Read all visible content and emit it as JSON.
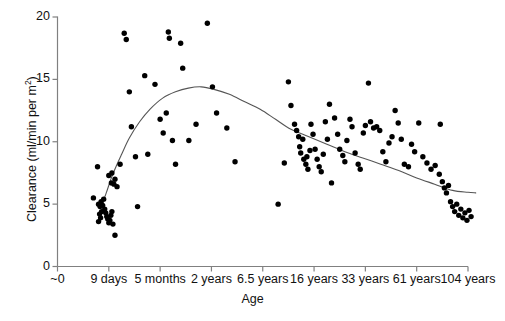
{
  "chart_data": {
    "type": "scatter",
    "title": "",
    "xlabel": "Age",
    "ylabel": "Clearance (ml/min per m²)",
    "ylim": [
      0,
      20
    ],
    "yticks": [
      0,
      5,
      10,
      15,
      20
    ],
    "ytick_labels": [
      "0",
      "5",
      "10",
      "15",
      "20"
    ],
    "xtick_labels": [
      "~0",
      "9 days",
      "5 months",
      "2 years",
      "6.5 years",
      "16 years",
      "33 years",
      "61 years",
      "104 years"
    ],
    "xtick_index": [
      0,
      1,
      2,
      3,
      4,
      5,
      6,
      7,
      8
    ],
    "grid": false,
    "legend": false,
    "marker_color": "#000000",
    "trend_color": "#555555",
    "axis_color": "#808080",
    "note": "x axis is an ordinal age scale; x values below are tick-index units (0 = ~0, 8 = 104 years)",
    "series": [
      {
        "name": "Clearance",
        "points": [
          [
            0.78,
            8.0
          ],
          [
            0.7,
            5.5
          ],
          [
            0.8,
            5.0
          ],
          [
            0.83,
            4.8
          ],
          [
            0.85,
            5.2
          ],
          [
            0.86,
            4.4
          ],
          [
            0.88,
            4.9
          ],
          [
            0.82,
            4.2
          ],
          [
            0.84,
            3.9
          ],
          [
            0.8,
            3.6
          ],
          [
            0.9,
            5.4
          ],
          [
            0.92,
            4.6
          ],
          [
            0.94,
            4.3
          ],
          [
            0.96,
            4.0
          ],
          [
            0.98,
            3.8
          ],
          [
            1.0,
            3.5
          ],
          [
            1.02,
            3.7
          ],
          [
            1.04,
            4.1
          ],
          [
            1.06,
            4.4
          ],
          [
            1.08,
            3.4
          ],
          [
            1.12,
            2.5
          ],
          [
            1.0,
            7.3
          ],
          [
            1.05,
            6.7
          ],
          [
            1.1,
            6.6
          ],
          [
            1.16,
            6.4
          ],
          [
            1.12,
            7.0
          ],
          [
            1.06,
            7.5
          ],
          [
            1.22,
            8.2
          ],
          [
            1.3,
            18.7
          ],
          [
            1.34,
            18.2
          ],
          [
            1.4,
            14.0
          ],
          [
            1.44,
            11.2
          ],
          [
            1.52,
            8.8
          ],
          [
            1.56,
            4.8
          ],
          [
            1.7,
            15.3
          ],
          [
            1.76,
            9.0
          ],
          [
            1.9,
            14.6
          ],
          [
            2.0,
            11.8
          ],
          [
            2.06,
            10.7
          ],
          [
            2.12,
            12.3
          ],
          [
            2.16,
            18.8
          ],
          [
            2.18,
            18.3
          ],
          [
            2.24,
            10.1
          ],
          [
            2.3,
            8.2
          ],
          [
            2.4,
            17.9
          ],
          [
            2.44,
            15.9
          ],
          [
            2.56,
            10.1
          ],
          [
            2.7,
            11.4
          ],
          [
            2.92,
            19.5
          ],
          [
            3.02,
            14.4
          ],
          [
            3.1,
            12.3
          ],
          [
            3.3,
            11.1
          ],
          [
            3.46,
            8.4
          ],
          [
            4.55,
            12.9
          ],
          [
            4.62,
            11.4
          ],
          [
            4.66,
            10.9
          ],
          [
            4.7,
            10.4
          ],
          [
            4.72,
            9.6
          ],
          [
            4.74,
            9.1
          ],
          [
            4.78,
            10.2
          ],
          [
            4.8,
            8.6
          ],
          [
            4.84,
            8.2
          ],
          [
            4.86,
            8.8
          ],
          [
            4.88,
            7.8
          ],
          [
            4.92,
            9.3
          ],
          [
            4.42,
            8.3
          ],
          [
            4.5,
            14.8
          ],
          [
            4.94,
            11.4
          ],
          [
            4.98,
            10.6
          ],
          [
            5.02,
            9.4
          ],
          [
            5.06,
            8.6
          ],
          [
            5.1,
            8.0
          ],
          [
            5.14,
            7.6
          ],
          [
            5.18,
            9.0
          ],
          [
            5.22,
            11.6
          ],
          [
            5.26,
            10.2
          ],
          [
            5.3,
            13.0
          ],
          [
            5.34,
            6.7
          ],
          [
            5.4,
            11.9
          ],
          [
            5.46,
            10.6
          ],
          [
            5.5,
            9.4
          ],
          [
            5.56,
            8.9
          ],
          [
            5.6,
            8.4
          ],
          [
            5.64,
            10.1
          ],
          [
            5.7,
            11.8
          ],
          [
            5.74,
            11.2
          ],
          [
            5.8,
            9.1
          ],
          [
            5.86,
            8.2
          ],
          [
            5.9,
            7.8
          ],
          [
            5.96,
            10.7
          ],
          [
            6.0,
            11.3
          ],
          [
            6.06,
            14.7
          ],
          [
            6.1,
            11.6
          ],
          [
            6.16,
            11.1
          ],
          [
            6.22,
            11.2
          ],
          [
            6.28,
            10.9
          ],
          [
            6.34,
            9.2
          ],
          [
            6.4,
            8.4
          ],
          [
            6.46,
            9.9
          ],
          [
            6.52,
            10.4
          ],
          [
            6.58,
            12.5
          ],
          [
            6.64,
            11.5
          ],
          [
            6.7,
            10.2
          ],
          [
            6.76,
            8.2
          ],
          [
            6.84,
            8.0
          ],
          [
            6.9,
            9.8
          ],
          [
            6.96,
            9.2
          ],
          [
            7.04,
            11.5
          ],
          [
            7.12,
            8.8
          ],
          [
            7.2,
            8.3
          ],
          [
            7.28,
            7.8
          ],
          [
            7.36,
            8.1
          ],
          [
            7.44,
            7.4
          ],
          [
            7.5,
            6.8
          ],
          [
            7.54,
            6.3
          ],
          [
            7.58,
            5.9
          ],
          [
            7.62,
            6.5
          ],
          [
            7.66,
            5.2
          ],
          [
            7.7,
            4.8
          ],
          [
            7.74,
            4.4
          ],
          [
            7.78,
            5.0
          ],
          [
            7.82,
            4.1
          ],
          [
            7.86,
            4.6
          ],
          [
            7.9,
            3.9
          ],
          [
            7.94,
            4.3
          ],
          [
            7.98,
            3.7
          ],
          [
            8.02,
            4.5
          ],
          [
            8.06,
            4.0
          ],
          [
            7.46,
            11.4
          ],
          [
            4.3,
            5.0
          ]
        ]
      }
    ],
    "trend_line": {
      "name": "fitted curve",
      "points": [
        [
          0.86,
          4.9
        ],
        [
          0.95,
          5.9
        ],
        [
          1.05,
          7.1
        ],
        [
          1.15,
          8.1
        ],
        [
          1.25,
          9.0
        ],
        [
          1.4,
          10.3
        ],
        [
          1.6,
          11.6
        ],
        [
          1.8,
          12.6
        ],
        [
          2.05,
          13.5
        ],
        [
          2.3,
          14.0
        ],
        [
          2.55,
          14.3
        ],
        [
          2.8,
          14.4
        ],
        [
          3.05,
          14.2
        ],
        [
          3.35,
          13.8
        ],
        [
          3.65,
          13.2
        ],
        [
          3.95,
          12.6
        ],
        [
          4.25,
          11.8
        ],
        [
          4.55,
          11.0
        ],
        [
          4.9,
          10.4
        ],
        [
          5.25,
          9.8
        ],
        [
          5.6,
          9.2
        ],
        [
          5.95,
          8.7
        ],
        [
          6.3,
          8.2
        ],
        [
          6.65,
          7.7
        ],
        [
          7.0,
          7.1
        ],
        [
          7.35,
          6.6
        ],
        [
          7.7,
          6.1
        ],
        [
          8.0,
          5.95
        ],
        [
          8.15,
          5.9
        ]
      ]
    }
  }
}
